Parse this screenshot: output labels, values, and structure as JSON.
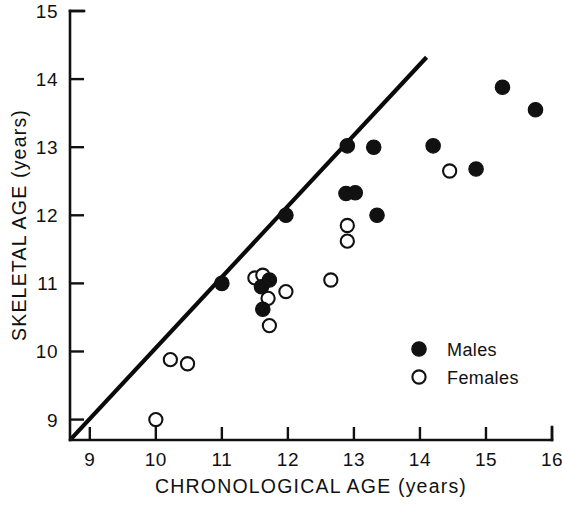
{
  "chart_data": {
    "type": "scatter",
    "title": "",
    "xlabel": "CHRONOLOGICAL AGE  (years)",
    "ylabel": "SKELETAL AGE  (years)",
    "xlim": [
      8.7,
      16.0
    ],
    "ylim": [
      8.7,
      15.0
    ],
    "xticks": [
      9,
      10,
      11,
      12,
      13,
      14,
      15,
      16
    ],
    "xtick_labels": [
      "9",
      "10",
      "11",
      "12",
      "13",
      "14",
      "15",
      "16"
    ],
    "yticks": [
      9,
      10,
      11,
      12,
      13,
      14,
      15
    ],
    "ytick_labels": [
      "9",
      "10",
      "11",
      "12",
      "13",
      "14",
      "15"
    ],
    "grid": false,
    "legend_position": "lower-right",
    "reference_line": {
      "label": "line of identity",
      "x": [
        8.72,
        14.1
      ],
      "y": [
        8.72,
        14.32
      ]
    },
    "series": [
      {
        "name": "Males",
        "marker": "filled-circle",
        "color": "#111111",
        "points": [
          {
            "x": 11.0,
            "y": 11.0
          },
          {
            "x": 11.6,
            "y": 10.95
          },
          {
            "x": 11.62,
            "y": 10.62
          },
          {
            "x": 11.72,
            "y": 11.05
          },
          {
            "x": 11.97,
            "y": 12.0
          },
          {
            "x": 12.9,
            "y": 13.02
          },
          {
            "x": 12.88,
            "y": 12.32
          },
          {
            "x": 13.02,
            "y": 12.33
          },
          {
            "x": 13.3,
            "y": 13.0
          },
          {
            "x": 13.35,
            "y": 12.0
          },
          {
            "x": 14.2,
            "y": 13.02
          },
          {
            "x": 14.85,
            "y": 12.68
          },
          {
            "x": 15.25,
            "y": 13.88
          },
          {
            "x": 15.75,
            "y": 13.55
          }
        ]
      },
      {
        "name": "Females",
        "marker": "open-circle",
        "color": "#ffffff",
        "points": [
          {
            "x": 10.0,
            "y": 9.0
          },
          {
            "x": 10.22,
            "y": 9.88
          },
          {
            "x": 10.48,
            "y": 9.82
          },
          {
            "x": 11.5,
            "y": 11.08
          },
          {
            "x": 11.62,
            "y": 11.12
          },
          {
            "x": 11.7,
            "y": 10.78
          },
          {
            "x": 11.72,
            "y": 10.38
          },
          {
            "x": 11.97,
            "y": 10.88
          },
          {
            "x": 12.65,
            "y": 11.05
          },
          {
            "x": 12.9,
            "y": 11.85
          },
          {
            "x": 12.9,
            "y": 11.62
          },
          {
            "x": 14.45,
            "y": 12.65
          }
        ]
      }
    ]
  },
  "legend": {
    "entries": [
      {
        "label": "Males",
        "marker": "filled-circle"
      },
      {
        "label": "Females",
        "marker": "open-circle"
      }
    ]
  }
}
